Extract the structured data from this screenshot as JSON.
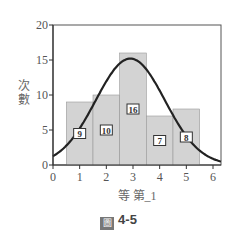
{
  "chart_data": {
    "type": "bar",
    "title": "",
    "x": [
      1,
      2,
      3,
      4,
      5
    ],
    "categories": [
      "1",
      "2",
      "3",
      "4",
      "5"
    ],
    "values": [
      9,
      10,
      16,
      7,
      8
    ],
    "value_labels": [
      "9",
      "10",
      "16",
      "7",
      "8"
    ],
    "overlay": {
      "type": "normal-curve",
      "peak_x": 2.9,
      "peak_y": 15.2
    },
    "xlabel": "等 第_1",
    "ylabel": "次數",
    "xlim": [
      0,
      6.3
    ],
    "ylim": [
      0,
      20
    ],
    "xticks": [
      "0",
      "1",
      "2",
      "3",
      "4",
      "5",
      "6"
    ],
    "yticks": [
      "0",
      "5",
      "10",
      "15",
      "20"
    ],
    "grid": false,
    "bar_color": "#d3d3d3",
    "curve_color": "#222222"
  },
  "caption": {
    "icon": "圖",
    "text": "4-5"
  }
}
